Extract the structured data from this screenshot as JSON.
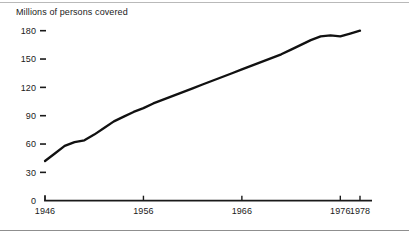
{
  "chart_data": {
    "type": "line",
    "title": "Millions of persons covered",
    "xlabel": "",
    "ylabel": "",
    "grid": false,
    "legend": false,
    "xlim": [
      1946,
      1979.5
    ],
    "ylim": [
      0,
      195
    ],
    "yticks": [
      0,
      30,
      60,
      90,
      120,
      150,
      180
    ],
    "ytick_labels": [
      "0",
      "30",
      "60",
      "90",
      "120",
      "150",
      "180"
    ],
    "xticks": [
      1946,
      1956,
      1966,
      1976,
      1978
    ],
    "xtick_labels": [
      "1946",
      "1956",
      "1966",
      "1976",
      "1978"
    ],
    "series": [
      {
        "name": "Persons covered",
        "x": [
          1946,
          1947,
          1948,
          1949,
          1950,
          1951,
          1952,
          1953,
          1954,
          1955,
          1956,
          1957,
          1958,
          1959,
          1960,
          1961,
          1962,
          1963,
          1964,
          1965,
          1966,
          1967,
          1968,
          1969,
          1970,
          1971,
          1972,
          1973,
          1974,
          1975,
          1976,
          1977,
          1978
        ],
        "values": [
          42,
          50,
          58,
          62,
          64,
          70,
          77,
          84,
          89,
          94,
          98,
          103,
          107,
          111,
          115,
          119,
          123,
          127,
          131,
          135,
          139,
          143,
          147,
          151,
          155,
          160,
          165,
          170,
          174,
          175,
          174,
          177,
          180
        ]
      }
    ]
  },
  "axis": {
    "origin_label": "0"
  }
}
